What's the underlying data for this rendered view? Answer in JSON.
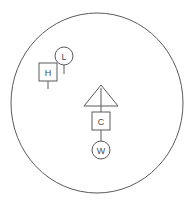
{
  "diagram": {
    "type": "symbol-map",
    "canvas": {
      "width": 195,
      "height": 207,
      "background": "#ffffff"
    },
    "stroke_color": "#5a5a5a",
    "label_color": "#4a4a4a",
    "boundary": {
      "name": "outer-circle",
      "shape": "ellipse",
      "cx": 97,
      "cy": 103,
      "rx": 86,
      "ry": 90,
      "stroke": "#5a5a5a",
      "stroke_width": 1,
      "fill": "none"
    },
    "symbols": [
      {
        "id": "low-pressure",
        "label": "L",
        "shape": "circle",
        "cx": 64,
        "cy": 56,
        "r": 9,
        "tail": {
          "from_y": 65,
          "to_y": 74
        }
      },
      {
        "id": "high-pressure",
        "label": "H",
        "shape": "square",
        "cx": 48,
        "cy": 72,
        "size": 18,
        "tail": {
          "from_y": 81,
          "to_y": 89
        }
      },
      {
        "id": "warning",
        "label": "",
        "shape": "triangle",
        "cx": 101,
        "cy": 98,
        "half_width": 17,
        "height": 21,
        "inner_line": {
          "from_y": 88,
          "to_y": 106
        },
        "tail": {
          "from_y": 98,
          "to_y": 106
        }
      },
      {
        "id": "cold",
        "label": "C",
        "shape": "square",
        "cx": 101,
        "cy": 121,
        "size": 18,
        "tail": {
          "from_y": 130,
          "to_y": 139
        }
      },
      {
        "id": "warm",
        "label": "W",
        "shape": "circle",
        "cx": 101,
        "cy": 150,
        "r": 9,
        "tail": {
          "from_y": 136,
          "to_y": 141
        }
      }
    ],
    "connectors": [
      {
        "id": "trunk-line",
        "x": 101,
        "from_y": 106,
        "to_y": 141
      }
    ]
  }
}
